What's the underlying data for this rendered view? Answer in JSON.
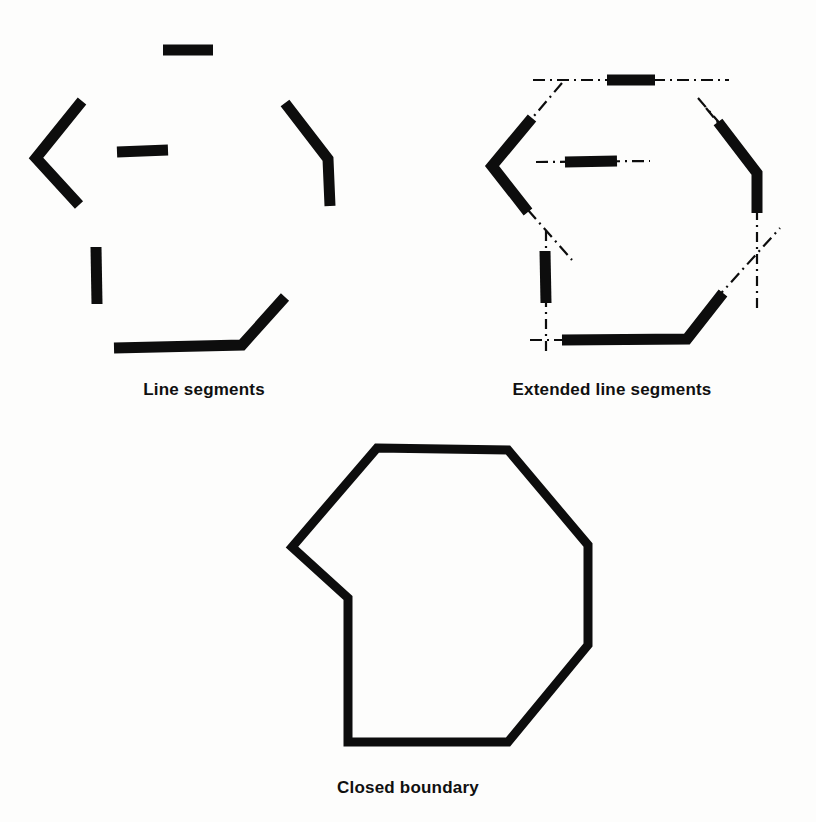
{
  "figure": {
    "background_color": "#fdfdfc",
    "ink_color": "#0d0d0d",
    "panels": [
      {
        "id": "line-segments",
        "caption": "Line segments"
      },
      {
        "id": "extended-line-segments",
        "caption": "Extended line segments"
      },
      {
        "id": "closed-boundary",
        "caption": "Closed boundary"
      }
    ]
  },
  "captions": {
    "line_segments": "Line segments",
    "extended_line_segments": "Extended line segments",
    "closed_boundary": "Closed boundary"
  },
  "chart_data": {
    "type": "diagram",
    "title": "",
    "panels": [
      {
        "name": "Line segments",
        "caption": "Line segments",
        "stroke_width": 11,
        "segments": [
          {
            "name": "top-horizontal",
            "points": [
              [
                163,
                50
              ],
              [
                213,
                50
              ]
            ]
          },
          {
            "name": "inner-horizontal",
            "points": [
              [
                117,
                152
              ],
              [
                168,
                150
              ]
            ]
          },
          {
            "name": "left-chevron",
            "points": [
              [
                82,
                101
              ],
              [
                36,
                158
              ],
              [
                79,
                205
              ]
            ]
          },
          {
            "name": "right-elbow",
            "points": [
              [
                285,
                103
              ],
              [
                328,
                159
              ],
              [
                330,
                206
              ]
            ]
          },
          {
            "name": "left-vertical",
            "points": [
              [
                96,
                247
              ],
              [
                97,
                304
              ]
            ]
          },
          {
            "name": "bottom-elbow",
            "points": [
              [
                114,
                348
              ],
              [
                242,
                345
              ],
              [
                285,
                297
              ]
            ]
          }
        ]
      },
      {
        "name": "Extended line segments",
        "caption": "Extended line segments",
        "stroke_width": 11,
        "extension_style": "dash-dot",
        "segments": [
          {
            "name": "top-horizontal",
            "points": [
              [
                607,
                80
              ],
              [
                655,
                80
              ]
            ]
          },
          {
            "name": "inner-horizontal",
            "points": [
              [
                565,
                162
              ],
              [
                617,
                161
              ]
            ]
          },
          {
            "name": "left-chevron",
            "points": [
              [
                532,
                118
              ],
              [
                492,
                166
              ],
              [
                528,
                212
              ]
            ]
          },
          {
            "name": "right-elbow",
            "points": [
              [
                718,
                122
              ],
              [
                757,
                173
              ],
              [
                757,
                213
              ]
            ]
          },
          {
            "name": "left-vertical",
            "points": [
              [
                545,
                251
              ],
              [
                546,
                303
              ]
            ]
          },
          {
            "name": "bottom-elbow",
            "points": [
              [
                562,
                340
              ],
              [
                687,
                339
              ],
              [
                723,
                293
              ]
            ]
          }
        ],
        "extensions": [
          {
            "name": "top-horizontal-extension",
            "points": [
              [
                533,
                80
              ],
              [
                729,
                80
              ]
            ]
          },
          {
            "name": "inner-horizontal-extension",
            "points": [
              [
                536,
                162
              ],
              [
                650,
                161
              ]
            ]
          },
          {
            "name": "left-chevron-upper-extension",
            "points": [
              [
                562,
                83
              ],
              [
                528,
                123
              ]
            ]
          },
          {
            "name": "left-chevron-lower-extension",
            "points": [
              [
                528,
                210
              ],
              [
                572,
                260
              ]
            ]
          },
          {
            "name": "right-elbow-upper-extension",
            "points": [
              [
                698,
                98
              ],
              [
                722,
                126
              ]
            ]
          },
          {
            "name": "right-elbow-diagonal-extension",
            "points": [
              [
                706,
                108
              ],
              [
                760,
                174
              ]
            ]
          },
          {
            "name": "right-vertical-extension",
            "points": [
              [
                757,
                210
              ],
              [
                757,
                310
              ]
            ]
          },
          {
            "name": "left-vertical-extension",
            "points": [
              [
                546,
                231
              ],
              [
                546,
                352
              ]
            ]
          },
          {
            "name": "bottom-horizontal-extension",
            "points": [
              [
                530,
                340
              ],
              [
                600,
                340
              ]
            ]
          },
          {
            "name": "bottom-diagonal-extension",
            "points": [
              [
                715,
                300
              ],
              [
                780,
                228
              ]
            ]
          }
        ]
      },
      {
        "name": "Closed boundary",
        "caption": "Closed boundary",
        "stroke_width": 9,
        "polygon": [
          [
            377,
            448
          ],
          [
            508,
            450
          ],
          [
            588,
            545
          ],
          [
            588,
            645
          ],
          [
            508,
            742
          ],
          [
            348,
            742
          ],
          [
            348,
            598
          ],
          [
            292,
            547
          ]
        ],
        "closed": true
      }
    ]
  }
}
